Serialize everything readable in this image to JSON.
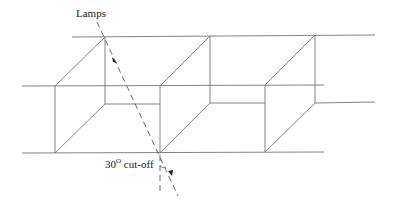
{
  "diagram": {
    "labels": {
      "lamps": "Lamps",
      "cutoff": "30",
      "cutoff_sup": "O",
      "cutoff_suffix": " cut-off"
    },
    "colors": {
      "line": "#555555",
      "dash": "#444444",
      "background": "#ffffff"
    }
  }
}
